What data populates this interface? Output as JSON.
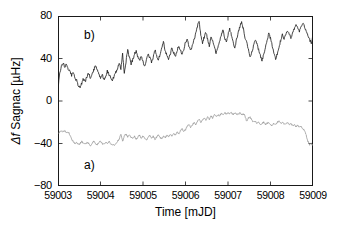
{
  "figure": {
    "background": "#ffffff",
    "frame_color": "#1a1a1a"
  },
  "axes": {
    "x_title": "Time [mJD]",
    "y_title_delta": "Δ",
    "y_title_f": "f",
    "y_title_rest": " Sagnac [µHz]",
    "y_title_plain": "Δf Sagnac [µHz]"
  },
  "annotations": {
    "curve_a_tag": "a)",
    "curve_b_tag": "b)"
  },
  "chart_data": {
    "type": "line",
    "title": "",
    "xlabel": "Time [mJD]",
    "ylabel": "Δf Sagnac [µHz]",
    "xlim": [
      59003,
      59009
    ],
    "ylim": [
      -80,
      80
    ],
    "xticks": [
      59003,
      59004,
      59005,
      59006,
      59007,
      59008,
      59009
    ],
    "xtick_labels": [
      "59003",
      "59004",
      "59005",
      "59006",
      "59007",
      "59008",
      "59009"
    ],
    "yticks": [
      -80,
      -40,
      0,
      40,
      80
    ],
    "ytick_labels": [
      "−80",
      "−40",
      "0",
      "40",
      "80"
    ],
    "grid": false,
    "legend": "none",
    "tick_direction": "in",
    "frame": "box",
    "series": [
      {
        "name": "b",
        "label": "b)",
        "color": "#1a1a1a",
        "linewidth": 0.8,
        "x": [
          59003.0,
          59003.04,
          59003.08,
          59003.12,
          59003.16,
          59003.2,
          59003.24,
          59003.28,
          59003.32,
          59003.36,
          59003.4,
          59003.44,
          59003.48,
          59003.52,
          59003.56,
          59003.6,
          59003.64,
          59003.68,
          59003.72,
          59003.76,
          59003.8,
          59003.84,
          59003.88,
          59003.92,
          59003.96,
          59004.0,
          59004.04,
          59004.08,
          59004.12,
          59004.16,
          59004.2,
          59004.24,
          59004.28,
          59004.32,
          59004.36,
          59004.4,
          59004.44,
          59004.48,
          59004.52,
          59004.56,
          59004.6,
          59004.64,
          59004.68,
          59004.72,
          59004.76,
          59004.8,
          59004.84,
          59004.88,
          59004.92,
          59004.96,
          59005.0,
          59005.04,
          59005.08,
          59005.12,
          59005.16,
          59005.2,
          59005.24,
          59005.28,
          59005.32,
          59005.36,
          59005.4,
          59005.44,
          59005.48,
          59005.52,
          59005.56,
          59005.6,
          59005.64,
          59005.68,
          59005.72,
          59005.76,
          59005.8,
          59005.84,
          59005.88,
          59005.92,
          59005.96,
          59006.0,
          59006.04,
          59006.08,
          59006.12,
          59006.16,
          59006.2,
          59006.24,
          59006.28,
          59006.32,
          59006.36,
          59006.4,
          59006.44,
          59006.48,
          59006.52,
          59006.56,
          59006.6,
          59006.64,
          59006.68,
          59006.72,
          59006.76,
          59006.8,
          59006.84,
          59006.88,
          59006.92,
          59006.96,
          59007.0,
          59007.04,
          59007.08,
          59007.12,
          59007.16,
          59007.2,
          59007.24,
          59007.28,
          59007.32,
          59007.36,
          59007.4,
          59007.44,
          59007.48,
          59007.52,
          59007.56,
          59007.6,
          59007.64,
          59007.68,
          59007.72,
          59007.76,
          59007.8,
          59007.84,
          59007.88,
          59007.92,
          59007.96,
          59008.0,
          59008.04,
          59008.08,
          59008.12,
          59008.16,
          59008.2,
          59008.24,
          59008.28,
          59008.32,
          59008.36,
          59008.4,
          59008.44,
          59008.48,
          59008.52,
          59008.56,
          59008.6,
          59008.64,
          59008.68,
          59008.72,
          59008.76,
          59008.8,
          59008.84,
          59008.88,
          59008.92,
          59008.96,
          59009.0
        ],
        "values": [
          12,
          26,
          33,
          36,
          32,
          35,
          30,
          28,
          24,
          27,
          22,
          19,
          14,
          12,
          17,
          21,
          18,
          23,
          26,
          22,
          25,
          29,
          34,
          30,
          26,
          22,
          25,
          20,
          23,
          28,
          25,
          22,
          20,
          23,
          27,
          31,
          35,
          30,
          44,
          27,
          37,
          48,
          41,
          35,
          39,
          44,
          47,
          41,
          38,
          43,
          37,
          33,
          38,
          44,
          41,
          36,
          41,
          48,
          43,
          39,
          43,
          50,
          56,
          47,
          43,
          39,
          44,
          50,
          46,
          42,
          47,
          52,
          48,
          44,
          49,
          55,
          58,
          52,
          47,
          52,
          58,
          63,
          70,
          75,
          62,
          55,
          60,
          65,
          58,
          52,
          61,
          57,
          51,
          45,
          50,
          56,
          62,
          67,
          60,
          55,
          62,
          68,
          62,
          56,
          50,
          58,
          64,
          70,
          74,
          68,
          60,
          55,
          48,
          42,
          46,
          52,
          58,
          54,
          48,
          43,
          38,
          44,
          50,
          58,
          63,
          59,
          52,
          45,
          40,
          44,
          51,
          57,
          62,
          58,
          62,
          66,
          63,
          60,
          64,
          68,
          71,
          69,
          66,
          70,
          73,
          70,
          66,
          62,
          58,
          54,
          62
        ]
      },
      {
        "name": "a",
        "label": "a)",
        "color": "#8c8c8c",
        "linewidth": 0.7,
        "x": [
          59003.0,
          59003.04,
          59003.08,
          59003.12,
          59003.16,
          59003.2,
          59003.24,
          59003.28,
          59003.32,
          59003.36,
          59003.4,
          59003.44,
          59003.48,
          59003.52,
          59003.56,
          59003.6,
          59003.64,
          59003.68,
          59003.72,
          59003.76,
          59003.8,
          59003.84,
          59003.88,
          59003.92,
          59003.96,
          59004.0,
          59004.04,
          59004.08,
          59004.12,
          59004.16,
          59004.2,
          59004.24,
          59004.28,
          59004.32,
          59004.36,
          59004.4,
          59004.44,
          59004.48,
          59004.52,
          59004.56,
          59004.6,
          59004.64,
          59004.68,
          59004.72,
          59004.76,
          59004.8,
          59004.84,
          59004.88,
          59004.92,
          59004.96,
          59005.0,
          59005.04,
          59005.08,
          59005.12,
          59005.16,
          59005.2,
          59005.24,
          59005.28,
          59005.32,
          59005.36,
          59005.4,
          59005.44,
          59005.48,
          59005.52,
          59005.56,
          59005.6,
          59005.64,
          59005.68,
          59005.72,
          59005.76,
          59005.8,
          59005.84,
          59005.88,
          59005.92,
          59005.96,
          59006.0,
          59006.04,
          59006.08,
          59006.12,
          59006.16,
          59006.2,
          59006.24,
          59006.28,
          59006.32,
          59006.36,
          59006.4,
          59006.44,
          59006.48,
          59006.52,
          59006.56,
          59006.6,
          59006.64,
          59006.68,
          59006.72,
          59006.76,
          59006.8,
          59006.84,
          59006.88,
          59006.92,
          59006.96,
          59007.0,
          59007.04,
          59007.08,
          59007.12,
          59007.16,
          59007.2,
          59007.24,
          59007.28,
          59007.32,
          59007.36,
          59007.4,
          59007.44,
          59007.48,
          59007.52,
          59007.56,
          59007.6,
          59007.64,
          59007.68,
          59007.72,
          59007.76,
          59007.8,
          59007.84,
          59007.88,
          59007.92,
          59007.96,
          59008.0,
          59008.04,
          59008.08,
          59008.12,
          59008.16,
          59008.2,
          59008.24,
          59008.28,
          59008.32,
          59008.36,
          59008.4,
          59008.44,
          59008.48,
          59008.52,
          59008.56,
          59008.6,
          59008.64,
          59008.68,
          59008.72,
          59008.76,
          59008.8,
          59008.84,
          59008.88,
          59008.92,
          59008.96,
          59009.0
        ],
        "values": [
          -31,
          -29,
          -28,
          -29,
          -28,
          -30,
          -29,
          -32,
          -36,
          -38,
          -40,
          -39,
          -41,
          -40,
          -38,
          -40,
          -41,
          -39,
          -40,
          -42,
          -40,
          -38,
          -40,
          -41,
          -39,
          -38,
          -40,
          -41,
          -39,
          -40,
          -38,
          -40,
          -41,
          -42,
          -40,
          -38,
          -36,
          -31,
          -38,
          -33,
          -31,
          -34,
          -32,
          -34,
          -35,
          -33,
          -36,
          -34,
          -32,
          -35,
          -33,
          -35,
          -37,
          -34,
          -32,
          -35,
          -33,
          -36,
          -34,
          -32,
          -34,
          -36,
          -33,
          -35,
          -32,
          -34,
          -31,
          -33,
          -30,
          -32,
          -29,
          -31,
          -28,
          -26,
          -29,
          -27,
          -24,
          -22,
          -25,
          -23,
          -20,
          -22,
          -19,
          -17,
          -20,
          -18,
          -16,
          -18,
          -15,
          -17,
          -14,
          -16,
          -13,
          -15,
          -13,
          -14,
          -12,
          -13,
          -11,
          -12,
          -11,
          -12,
          -11,
          -13,
          -11,
          -12,
          -13,
          -11,
          -13,
          -12,
          -14,
          -19,
          -16,
          -15,
          -18,
          -20,
          -19,
          -21,
          -20,
          -22,
          -21,
          -20,
          -22,
          -21,
          -20,
          -22,
          -23,
          -21,
          -22,
          -20,
          -19,
          -21,
          -20,
          -22,
          -21,
          -20,
          -22,
          -21,
          -23,
          -22,
          -24,
          -23,
          -25,
          -24,
          -26,
          -28,
          -32,
          -38,
          -41,
          -40,
          -42
        ]
      }
    ]
  }
}
